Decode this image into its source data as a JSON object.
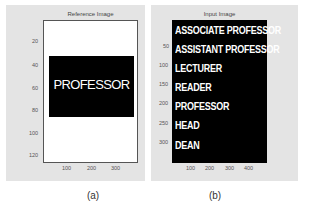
{
  "figure_a": {
    "title": "Reference Image",
    "caption": "(a)",
    "image_text": "PROFESSOR",
    "y_ticks": [
      "20",
      "40",
      "60",
      "80",
      "100",
      "120"
    ],
    "x_ticks": [
      "100",
      "200",
      "300"
    ],
    "colors": {
      "panel": "#e4e4e4",
      "image_bg": "#ffffff",
      "text_box": "#000000",
      "text": "#ffffff"
    }
  },
  "figure_b": {
    "title": "Input Image",
    "caption": "(b)",
    "lines": [
      "ASSOCIATE PROFESSOR",
      "ASSISTANT PROFESSOR",
      "LECTURER",
      "READER",
      "PROFESSOR",
      "HEAD",
      "DEAN"
    ],
    "y_ticks": [
      "50",
      "100",
      "150",
      "200",
      "250",
      "300"
    ],
    "x_ticks": [
      "100",
      "200",
      "300",
      "400"
    ],
    "colors": {
      "panel": "#e4e4e4",
      "image_bg": "#000000",
      "text": "#ffffff"
    }
  }
}
